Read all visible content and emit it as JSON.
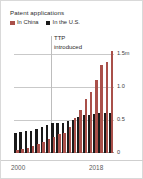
{
  "title": "Patent applications",
  "legend": [
    {
      "label": "In China",
      "color": "#a9504a",
      "name": "china"
    },
    {
      "label": "In the U.S.",
      "color": "#1a1a1a",
      "name": "us"
    }
  ],
  "annotation": {
    "line1": "TTP",
    "line2": "introduced"
  },
  "axis": {
    "y_ticks": [
      "1.5m",
      "1.0",
      "0.5",
      "0"
    ],
    "x_ticks": [
      "2000",
      "2018"
    ]
  },
  "chart_data": {
    "type": "bar",
    "title": "Patent applications",
    "xlabel": "",
    "ylabel": "",
    "ylim": [
      0,
      1.5
    ],
    "yunit": "millions",
    "grid": true,
    "legend_position": "top-left",
    "categories": [
      "2000",
      "2001",
      "2002",
      "2003",
      "2004",
      "2005",
      "2006",
      "2007",
      "2008",
      "2009",
      "2010",
      "2011",
      "2012",
      "2013",
      "2014",
      "2015",
      "2016",
      "2017",
      "2018"
    ],
    "series": [
      {
        "name": "In the U.S.",
        "color": "#1a1a1a",
        "values": [
          0.3,
          0.32,
          0.33,
          0.34,
          0.36,
          0.39,
          0.42,
          0.45,
          0.46,
          0.46,
          0.49,
          0.5,
          0.54,
          0.57,
          0.58,
          0.59,
          0.61,
          0.61,
          0.6
        ]
      },
      {
        "name": "In China",
        "color": "#a9504a",
        "values": [
          0.05,
          0.06,
          0.08,
          0.11,
          0.13,
          0.17,
          0.21,
          0.25,
          0.29,
          0.31,
          0.39,
          0.53,
          0.65,
          0.82,
          0.93,
          1.1,
          1.34,
          1.38,
          1.54
        ]
      }
    ],
    "annotations": [
      {
        "text": "TTP introduced",
        "x": "2008",
        "type": "vertical-line"
      }
    ]
  }
}
